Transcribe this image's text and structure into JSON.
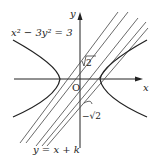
{
  "diagram": {
    "equation_label": "x² − 3y² = 3",
    "line_label": "y = x + k",
    "axis_x_label": "x",
    "axis_y_label": "y",
    "origin_label": "O",
    "upper_intercept_label": "√2",
    "lower_intercept_label": "−√2",
    "colors": {
      "stroke": "#222222",
      "background": "#ffffff"
    }
  }
}
